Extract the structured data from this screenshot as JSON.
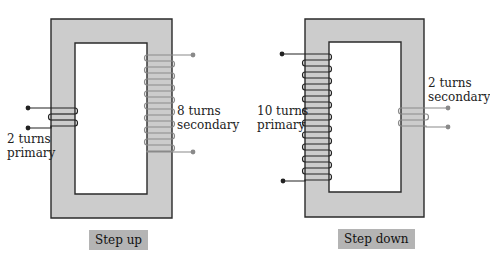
{
  "colors": {
    "core_fill": "#cccccc",
    "core_stroke": "#2a2a2a",
    "primary_wire": "#222222",
    "secondary_wire": "#8a8a8a",
    "caption_bg": "#b4b4b4"
  },
  "step_up": {
    "caption": "Step up",
    "primary": {
      "turns_line1": "2 turns",
      "turns_line2": "primary",
      "turns": 2
    },
    "secondary": {
      "turns_line1": "8 turns",
      "turns_line2": "secondary",
      "turns": 8
    }
  },
  "step_down": {
    "caption": "Step down",
    "primary": {
      "turns_line1": "10 turns",
      "turns_line2": "primary",
      "turns": 10
    },
    "secondary": {
      "turns_line1": "2 turns",
      "turns_line2": "secondary",
      "turns": 2
    }
  }
}
